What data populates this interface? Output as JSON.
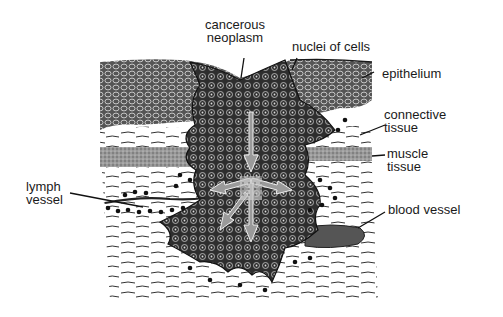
{
  "diagram": {
    "labels": {
      "cancerous_neoplasm": [
        "cancerous",
        "neoplasm"
      ],
      "nuclei_of_cells": "nuclei of cells",
      "epithelium": "epithelium",
      "connective_tissue": [
        "connective",
        "tissue"
      ],
      "muscle_tissue": [
        "muscle",
        "tissue"
      ],
      "lymph_vessel": [
        "lymph",
        "vessel"
      ],
      "blood_vessel": "blood vessel"
    },
    "colors": {
      "ink": "#1a1a1a",
      "tumor": "#3a3a3a",
      "muscle": "#8a8a8a",
      "vessel": "#555555",
      "arrow": "#9a9a9a",
      "background": "#ffffff"
    }
  }
}
